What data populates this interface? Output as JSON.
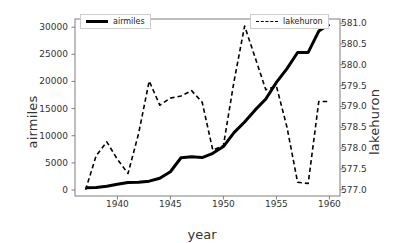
{
  "chart_data": {
    "type": "line",
    "title": "",
    "xlabel": "year",
    "ylabel": "airmiles",
    "ylabel_right": "lakehuron",
    "grid": false,
    "legend_position": "upper-left and upper-right",
    "x": [
      1937,
      1938,
      1939,
      1940,
      1941,
      1942,
      1943,
      1944,
      1945,
      1946,
      1947,
      1948,
      1949,
      1950,
      1951,
      1952,
      1953,
      1954,
      1955,
      1956,
      1957,
      1958,
      1959,
      1960
    ],
    "xlim": [
      1936.0,
      1961.0
    ],
    "xticks": [
      1940,
      1945,
      1950,
      1955,
      1960
    ],
    "xticklabels": [
      "1940",
      "1945",
      "1950",
      "1955",
      "1960"
    ],
    "ylim_left": [
      -1100,
      31500
    ],
    "yticks_left": [
      0,
      5000,
      10000,
      15000,
      20000,
      25000,
      30000
    ],
    "yticklabels_left": [
      "0",
      "5000",
      "10000",
      "15000",
      "20000",
      "25000",
      "30000"
    ],
    "ylim_right": [
      576.85,
      581.1
    ],
    "yticks_right": [
      577.0,
      577.5,
      578.0,
      578.5,
      579.0,
      579.5,
      580.0,
      580.5,
      581.0
    ],
    "yticklabels_right": [
      "577.0",
      "577.5",
      "578.0",
      "578.5",
      "579.0",
      "579.5",
      "580.0",
      "580.5",
      "581.0"
    ],
    "series": [
      {
        "name": "airmiles",
        "axis": "left",
        "color": "#000000",
        "linestyle": "solid",
        "linewidth": 3,
        "values": [
          412,
          480,
          683,
          1052,
          1385,
          1418,
          1634,
          2178,
          3362,
          5948,
          6109,
          5981,
          6753,
          8003,
          10566,
          12528,
          14760,
          16769,
          19819,
          22362,
          25340,
          25343,
          29269,
          30514
        ]
      },
      {
        "name": "lakehuron",
        "axis": "right",
        "color": "#000000",
        "linestyle": "dashed",
        "linewidth": 1.6,
        "values": [
          577.0,
          577.82,
          578.15,
          577.73,
          577.39,
          578.35,
          579.61,
          579.03,
          579.2,
          579.25,
          579.38,
          579.1,
          577.95,
          578.06,
          579.6,
          580.93,
          580.17,
          579.4,
          579.49,
          578.5,
          577.18,
          577.15,
          579.12,
          579.12
        ]
      }
    ]
  },
  "legend": {
    "airmiles_label": "airmiles",
    "lakehuron_label": "lakehuron"
  },
  "axes": {
    "frame_color": "#7f7f7f",
    "text_color": "#333333"
  }
}
